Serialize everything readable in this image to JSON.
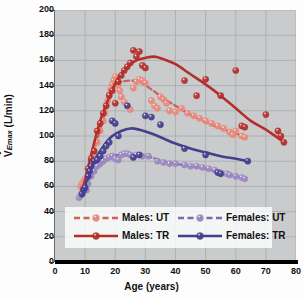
{
  "chart_data": {
    "type": "scatter",
    "title": "",
    "xlabel": "Age (years)",
    "ylabel": "V̇Emax (L/min)",
    "ylabel_main": "V",
    "ylabel_sub": "Emax",
    "ylabel_unit": " (L/min)",
    "xlim": [
      0,
      80
    ],
    "ylim": [
      0,
      200
    ],
    "xticks": [
      0,
      10,
      20,
      30,
      40,
      50,
      60,
      70,
      80
    ],
    "yticks": [
      0,
      20,
      40,
      60,
      80,
      100,
      120,
      140,
      160,
      180,
      200
    ],
    "grid": true,
    "legend_position": "lower-center",
    "colors": {
      "males_ut": "#e8897c",
      "males_tr": "#b42f2c",
      "females_ut": "#9d88c2",
      "females_tr": "#463f8e",
      "plot_background": "#c9cbcc",
      "grid_line": "#aeb1b3",
      "axis": "#000000"
    },
    "series": [
      {
        "name": "Males: UT",
        "key": "males_ut",
        "color": "#e8897c",
        "line_color": "#c9635a",
        "line_style": "dashed",
        "points": [
          [
            8.5,
            60
          ],
          [
            9.0,
            62
          ],
          [
            9.5,
            64
          ],
          [
            10.0,
            66
          ],
          [
            10.5,
            63
          ],
          [
            11.0,
            70
          ],
          [
            12.0,
            78
          ],
          [
            13.0,
            86
          ],
          [
            14.0,
            95
          ],
          [
            15.0,
            104
          ],
          [
            16.0,
            112
          ],
          [
            16.5,
            118
          ],
          [
            17.0,
            124
          ],
          [
            17.5,
            128
          ],
          [
            18.0,
            133
          ],
          [
            18.5,
            137
          ],
          [
            19.0,
            141
          ],
          [
            19.5,
            144
          ],
          [
            20.0,
            147
          ],
          [
            20.5,
            143
          ],
          [
            21.0,
            140
          ],
          [
            21.5,
            136
          ],
          [
            22.0,
            131
          ],
          [
            23.0,
            127
          ],
          [
            24.0,
            124
          ],
          [
            25.0,
            121
          ],
          [
            26.0,
            138
          ],
          [
            27.0,
            143
          ],
          [
            28.0,
            145
          ],
          [
            29.0,
            144
          ],
          [
            30.0,
            142
          ],
          [
            32.0,
            128
          ],
          [
            33.0,
            124
          ],
          [
            34.0,
            122
          ],
          [
            35.0,
            131
          ],
          [
            36.0,
            129
          ],
          [
            37.0,
            126
          ],
          [
            38.0,
            120
          ],
          [
            40.0,
            119
          ],
          [
            42.0,
            122
          ],
          [
            44.0,
            118
          ],
          [
            46.0,
            116
          ],
          [
            48.0,
            114
          ],
          [
            50.0,
            112
          ],
          [
            52.0,
            110
          ],
          [
            54.0,
            108
          ],
          [
            56.0,
            106
          ],
          [
            58.0,
            103
          ],
          [
            59.0,
            101
          ],
          [
            60.0,
            104
          ],
          [
            62.0,
            100
          ],
          [
            63.0,
            99
          ]
        ],
        "fit": [
          [
            9,
            62
          ],
          [
            12,
            80
          ],
          [
            15,
            105
          ],
          [
            18,
            130
          ],
          [
            20,
            141
          ],
          [
            22,
            143
          ],
          [
            25,
            144
          ],
          [
            28,
            143
          ],
          [
            32,
            137
          ],
          [
            36,
            130
          ],
          [
            40,
            124
          ],
          [
            45,
            117
          ],
          [
            50,
            111
          ],
          [
            55,
            106
          ],
          [
            60,
            102
          ],
          [
            63,
            100
          ]
        ]
      },
      {
        "name": "Males: TR",
        "key": "males_tr",
        "color": "#b42f2c",
        "line_color": "#b42f2c",
        "line_style": "solid",
        "points": [
          [
            9.5,
            58
          ],
          [
            11.0,
            74
          ],
          [
            12.0,
            82
          ],
          [
            13.0,
            88
          ],
          [
            14.0,
            104
          ],
          [
            15.0,
            110
          ],
          [
            16.0,
            118
          ],
          [
            17.0,
            124
          ],
          [
            18.0,
            132
          ],
          [
            19.0,
            136
          ],
          [
            20.0,
            126
          ],
          [
            21.0,
            143
          ],
          [
            22.0,
            148
          ],
          [
            23.0,
            152
          ],
          [
            24.0,
            155
          ],
          [
            25.0,
            158
          ],
          [
            26.0,
            168
          ],
          [
            27.0,
            163
          ],
          [
            28.0,
            167
          ],
          [
            29.0,
            156
          ],
          [
            30.0,
            154
          ],
          [
            43.0,
            144
          ],
          [
            47.0,
            132
          ],
          [
            50.0,
            145
          ],
          [
            55.0,
            132
          ],
          [
            60.0,
            152
          ],
          [
            62.0,
            108
          ],
          [
            63.0,
            107
          ],
          [
            70.0,
            117
          ],
          [
            74.0,
            104
          ],
          [
            75.0,
            100
          ],
          [
            76.0,
            95
          ]
        ],
        "fit": [
          [
            9,
            55
          ],
          [
            12,
            85
          ],
          [
            15,
            112
          ],
          [
            18,
            131
          ],
          [
            21,
            146
          ],
          [
            24,
            155
          ],
          [
            27,
            160
          ],
          [
            30,
            162
          ],
          [
            33,
            163
          ],
          [
            36,
            161
          ],
          [
            40,
            157
          ],
          [
            45,
            149
          ],
          [
            50,
            141
          ],
          [
            55,
            132
          ],
          [
            60,
            122
          ],
          [
            65,
            112
          ],
          [
            70,
            105
          ],
          [
            76,
            95
          ]
        ]
      },
      {
        "name": "Females: UT",
        "key": "females_ut",
        "color": "#9d88c2",
        "line_color": "#7d6aa8",
        "line_style": "dashed",
        "points": [
          [
            8.0,
            51
          ],
          [
            8.5,
            53
          ],
          [
            9.0,
            55
          ],
          [
            9.5,
            58
          ],
          [
            10.0,
            60
          ],
          [
            10.5,
            57
          ],
          [
            11.0,
            62
          ],
          [
            12.0,
            68
          ],
          [
            13.0,
            72
          ],
          [
            14.0,
            76
          ],
          [
            15.0,
            78
          ],
          [
            16.0,
            80
          ],
          [
            17.0,
            82
          ],
          [
            18.0,
            83
          ],
          [
            19.0,
            84
          ],
          [
            20.0,
            82
          ],
          [
            21.0,
            81
          ],
          [
            22.0,
            85
          ],
          [
            23.0,
            86
          ],
          [
            24.0,
            86
          ],
          [
            25.0,
            85
          ],
          [
            27.0,
            85
          ],
          [
            29.0,
            84
          ],
          [
            31.0,
            84
          ],
          [
            34.0,
            80
          ],
          [
            36.0,
            79
          ],
          [
            38.0,
            78
          ],
          [
            40.0,
            78
          ],
          [
            43.0,
            77
          ],
          [
            45.0,
            76
          ],
          [
            47.0,
            76
          ],
          [
            49.0,
            75
          ],
          [
            51.0,
            74
          ],
          [
            53.0,
            73
          ],
          [
            55.0,
            71
          ],
          [
            57.0,
            70
          ],
          [
            58.0,
            69
          ],
          [
            60.0,
            68
          ],
          [
            62.0,
            67
          ],
          [
            63.0,
            66
          ]
        ],
        "fit": [
          [
            9,
            56
          ],
          [
            12,
            68
          ],
          [
            15,
            78
          ],
          [
            18,
            83
          ],
          [
            21,
            85
          ],
          [
            24,
            86
          ],
          [
            28,
            85
          ],
          [
            32,
            83
          ],
          [
            36,
            80
          ],
          [
            40,
            78
          ],
          [
            45,
            76
          ],
          [
            50,
            74
          ],
          [
            55,
            71
          ],
          [
            60,
            68
          ],
          [
            63,
            66
          ]
        ]
      },
      {
        "name": "Females: TR",
        "key": "females_tr",
        "color": "#463f8e",
        "line_color": "#463f8e",
        "line_style": "solid",
        "points": [
          [
            9.0,
            54
          ],
          [
            9.5,
            57
          ],
          [
            10.0,
            59
          ],
          [
            11.0,
            68
          ],
          [
            11.5,
            72
          ],
          [
            12.0,
            76
          ],
          [
            13.0,
            80
          ],
          [
            14.0,
            81
          ],
          [
            15.0,
            84
          ],
          [
            16.0,
            88
          ],
          [
            17.0,
            92
          ],
          [
            18.0,
            95
          ],
          [
            19.0,
            112
          ],
          [
            20.0,
            110
          ],
          [
            21.0,
            100
          ],
          [
            24.0,
            124
          ],
          [
            26.0,
            83
          ],
          [
            28.0,
            85
          ],
          [
            30.0,
            116
          ],
          [
            32.0,
            115
          ],
          [
            35.0,
            109
          ],
          [
            43.0,
            90
          ],
          [
            50.0,
            85
          ],
          [
            54.0,
            71
          ],
          [
            55.0,
            70
          ],
          [
            64.0,
            80
          ]
        ],
        "fit": [
          [
            9,
            52
          ],
          [
            11,
            68
          ],
          [
            13,
            80
          ],
          [
            15,
            88
          ],
          [
            17,
            95
          ],
          [
            19,
            100
          ],
          [
            22,
            104
          ],
          [
            25,
            106
          ],
          [
            28,
            105
          ],
          [
            32,
            102
          ],
          [
            36,
            98
          ],
          [
            40,
            94
          ],
          [
            45,
            90
          ],
          [
            50,
            87
          ],
          [
            55,
            84
          ],
          [
            60,
            82
          ],
          [
            64,
            80
          ]
        ]
      }
    ]
  },
  "axes": {
    "y_tick_labels": [
      "0",
      "20",
      "40",
      "60",
      "80",
      "100",
      "120",
      "140",
      "160",
      "180",
      "200"
    ],
    "x_tick_labels": [
      "0",
      "10",
      "20",
      "30",
      "40",
      "50",
      "60",
      "70",
      "80"
    ],
    "x_title": "Age (years)"
  },
  "legend": {
    "entries": [
      {
        "label": "Males: UT",
        "style": "dashed",
        "color": "#e8897c",
        "line": "#c9635a"
      },
      {
        "label": "Females: UT",
        "style": "dashed",
        "color": "#9d88c2",
        "line": "#7d6aa8"
      },
      {
        "label": "Males: TR",
        "style": "solid",
        "color": "#b42f2c",
        "line": "#b42f2c"
      },
      {
        "label": "Females: TR",
        "style": "solid",
        "color": "#463f8e",
        "line": "#463f8e"
      }
    ]
  }
}
